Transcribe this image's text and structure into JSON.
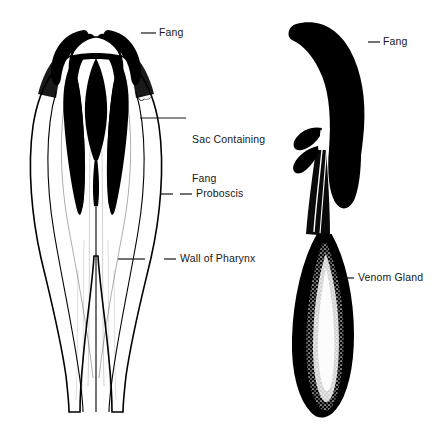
{
  "figure": {
    "background_color": "#ffffff",
    "ink_color": "#000000",
    "text_color": "#171717",
    "width": 445,
    "height": 429
  },
  "panels": [
    {
      "id": "pharynx-panel",
      "name": "Pharynx with fangs (sectioned view)",
      "view": "longitudinal section"
    },
    {
      "id": "fang-gland-panel",
      "name": "Isolated fang with venom gland",
      "view": "lateral view"
    }
  ],
  "annotations": [
    {
      "id": "fang-left",
      "label": "Fang",
      "lines": [
        "Fang"
      ],
      "text_x": 159,
      "text_y": 27,
      "leader": {
        "x1": 141,
        "y1": 33,
        "x2": 156,
        "y2": 33
      },
      "panel": "pharynx-panel"
    },
    {
      "id": "sac-containing-fang",
      "label": "Sac Containing Fang",
      "lines": [
        "Sac Containing",
        "Fang"
      ],
      "text_x": 192,
      "text_y": 108,
      "leader": {
        "x1": 140,
        "y1": 118,
        "x2": 186,
        "y2": 118
      },
      "tick": {
        "x1": 140,
        "y1": 118,
        "x2": 186,
        "y2": 118
      },
      "panel": "pharynx-panel"
    },
    {
      "id": "proboscis",
      "label": "Proboscis",
      "lines": [
        "Proboscis"
      ],
      "text_x": 196,
      "text_y": 188,
      "leader": {
        "x1": 180,
        "y1": 194,
        "x2": 192,
        "y2": 194
      },
      "tick": {
        "x1": 160,
        "y1": 194,
        "x2": 173,
        "y2": 194
      },
      "panel": "pharynx-panel"
    },
    {
      "id": "wall-of-pharynx",
      "label": "Wall of Pharynx",
      "lines": [
        "Wall of Pharynx"
      ],
      "text_x": 180,
      "text_y": 253,
      "leader": {
        "x1": 164,
        "y1": 259,
        "x2": 176,
        "y2": 259
      },
      "tick": {
        "x1": 118,
        "y1": 259,
        "x2": 145,
        "y2": 259
      },
      "panel": "pharynx-panel"
    },
    {
      "id": "fang-right",
      "label": "Fang",
      "lines": [
        "Fang"
      ],
      "text_x": 383,
      "text_y": 36,
      "leader": {
        "x1": 368,
        "y1": 42,
        "x2": 380,
        "y2": 42
      },
      "panel": "fang-gland-panel"
    },
    {
      "id": "venom-gland",
      "label": "Venom Gland",
      "lines": [
        "Venom Gland"
      ],
      "text_x": 358,
      "text_y": 272,
      "leader": {
        "x1": 342,
        "y1": 278,
        "x2": 354,
        "y2": 278
      },
      "panel": "fang-gland-panel"
    }
  ]
}
